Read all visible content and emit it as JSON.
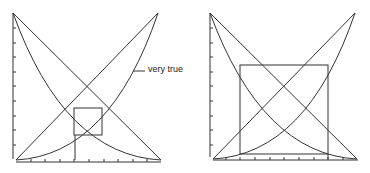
{
  "figure": {
    "panels": [
      {
        "id": "left",
        "annotation": "very true",
        "curves": [
          "true (linear increasing)",
          "false (linear decreasing)",
          "very true (squared increasing)",
          "very false (squared decreasing)"
        ],
        "box": "small fixed-point square near center"
      },
      {
        "id": "right",
        "curves": [
          "true (linear increasing)",
          "false (linear decreasing)",
          "very true (squared increasing)",
          "very false (squared decreasing)"
        ],
        "box": "large square spanning most of plot"
      }
    ],
    "stroke_color": "#333333",
    "background": "#ffffff"
  }
}
